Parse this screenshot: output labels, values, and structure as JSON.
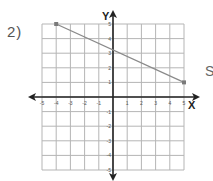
{
  "problem": {
    "number_label": "2)",
    "side_text": "S"
  },
  "colors": {
    "grid": "#b5b5b5",
    "axis": "#222222",
    "line": "#8a8a8a",
    "point": "#7a7a7a",
    "label": "#555555"
  },
  "chart_data": {
    "type": "line",
    "title": "",
    "xlabel": "X",
    "ylabel": "Y",
    "xlim": [
      -5,
      5
    ],
    "ylim": [
      -5,
      5
    ],
    "grid": true,
    "x_ticks": [
      -5,
      -4,
      -3,
      -2,
      -1,
      1,
      2,
      3,
      4,
      5
    ],
    "y_ticks": [
      -5,
      -4,
      -3,
      -2,
      -1,
      1,
      2,
      3,
      4,
      5
    ],
    "series": [
      {
        "name": "segment",
        "points": [
          [
            -4,
            5
          ],
          [
            5,
            1
          ]
        ]
      }
    ]
  }
}
